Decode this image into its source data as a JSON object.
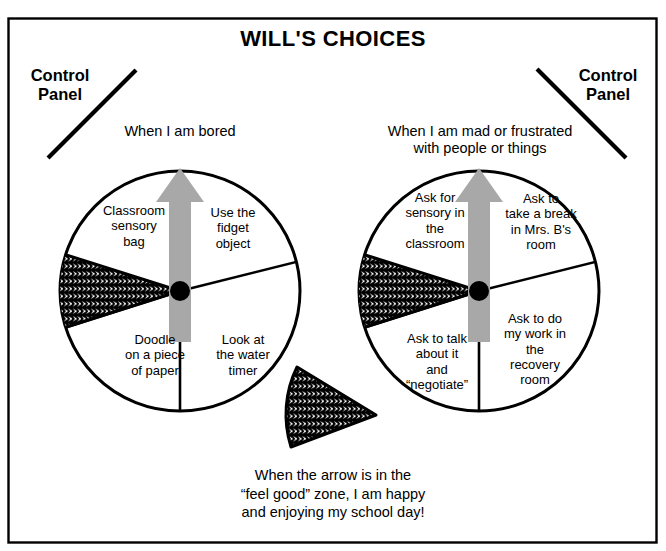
{
  "poster": {
    "title": "WILL'S CHOICES",
    "border_color": "#000000",
    "background": "#ffffff"
  },
  "control_panels": [
    {
      "name": "left",
      "label": "Control\nPanel",
      "pointer": "diagonal-line"
    },
    {
      "name": "right",
      "label": "Control\nPanel",
      "pointer": "diagonal-line"
    }
  ],
  "wheels": [
    {
      "id": "left",
      "heading": "When I am bored",
      "arrow_color": "#a8a8a8",
      "hub_color": "#000000",
      "feel_good_zone": {
        "present": true,
        "fill": "scale-hatch",
        "position": "left"
      },
      "slices": [
        {
          "label": "Classroom\nsensory\nbag"
        },
        {
          "label": "Use the\nfidget\nobject"
        },
        {
          "label": "Doodle\non a piece\nof paper"
        },
        {
          "label": "Look at\nthe water\ntimer"
        }
      ]
    },
    {
      "id": "right",
      "heading": "When I am mad or frustrated\nwith people or things",
      "arrow_color": "#a8a8a8",
      "hub_color": "#000000",
      "feel_good_zone": {
        "present": true,
        "fill": "scale-hatch",
        "position": "left"
      },
      "slices": [
        {
          "label": "Ask for\nsensory in\nthe\nclassroom"
        },
        {
          "label": "Ask to\ntake a break\nin Mrs. B's\nroom"
        },
        {
          "label": "Ask to talk\nabout it\nand\n“negotiate”"
        },
        {
          "label": "Ask to do\nmy work in\nthe\nrecovery\nroom"
        }
      ]
    }
  ],
  "legend_wedge": {
    "fill": "scale-hatch",
    "caption": "When the arrow is in the\n“feel good” zone, I am happy\nand enjoying my school day!"
  }
}
